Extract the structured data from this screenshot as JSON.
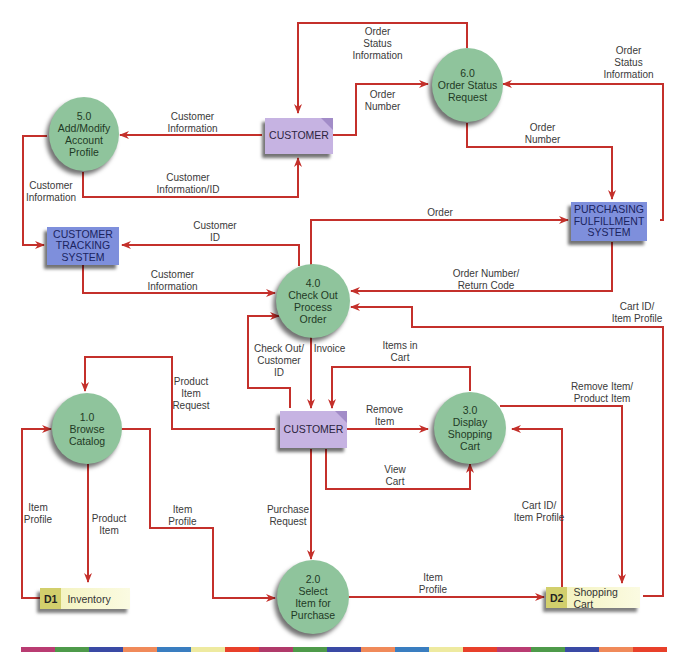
{
  "diagram": {
    "type": "data-flow-diagram",
    "arrow_color": "#c4302b",
    "processes": [
      {
        "id": "1.0",
        "number": "1.0",
        "name": "Browse\nCatalog",
        "lines": [
          "Browse",
          "Catalog"
        ]
      },
      {
        "id": "2.0",
        "number": "2.0",
        "name": "Select Item for Purchase",
        "lines": [
          "Select",
          "Item for",
          "Purchase"
        ]
      },
      {
        "id": "3.0",
        "number": "3.0",
        "name": "Display Shopping Cart",
        "lines": [
          "Display",
          "Shopping",
          "Cart"
        ]
      },
      {
        "id": "4.0",
        "number": "4.0",
        "name": "Check Out Process Order",
        "lines": [
          "Check Out",
          "Process",
          "Order"
        ]
      },
      {
        "id": "5.0",
        "number": "5.0",
        "name": "Add/Modify Account Profile",
        "lines": [
          "Add/Modify",
          "Account",
          "Profile"
        ]
      },
      {
        "id": "6.0",
        "number": "6.0",
        "name": "Order Status Request",
        "lines": [
          "Order Status",
          "Request"
        ]
      }
    ],
    "entities": {
      "customer_top": {
        "label": "CUSTOMER"
      },
      "customer_mid": {
        "label": "CUSTOMER"
      },
      "customer_tracking": {
        "lines": [
          "CUSTOMER",
          "TRACKING",
          "SYSTEM"
        ]
      },
      "purchasing": {
        "lines": [
          "PURCHASING",
          "FULFILLMENT",
          "SYSTEM"
        ]
      }
    },
    "data_stores": [
      {
        "id": "D1",
        "name": "Inventory"
      },
      {
        "id": "D2",
        "name": "Shopping Cart"
      }
    ],
    "flows": [
      {
        "label": "Order\nStatus\nInformation",
        "from": "6.0",
        "to": "CUSTOMER"
      },
      {
        "label": "Order\nNumber",
        "from": "CUSTOMER",
        "to": "6.0"
      },
      {
        "label": "Order\nStatus\nInformation",
        "from": "PURCHASING FULFILLMENT SYSTEM",
        "to": "6.0"
      },
      {
        "label": "Order\nNumber",
        "from": "6.0",
        "to": "PURCHASING FULFILLMENT SYSTEM"
      },
      {
        "label": "Customer\nInformation",
        "from": "CUSTOMER",
        "to": "5.0"
      },
      {
        "label": "Customer\nInformation/ID",
        "from": "5.0",
        "to": "CUSTOMER"
      },
      {
        "label": "Customer\nInformation",
        "from": "5.0",
        "to": "CUSTOMER TRACKING SYSTEM"
      },
      {
        "label": "Customer\nID",
        "from": "4.0",
        "to": "CUSTOMER TRACKING SYSTEM"
      },
      {
        "label": "Customer\nInformation",
        "from": "CUSTOMER TRACKING SYSTEM",
        "to": "4.0"
      },
      {
        "label": "Order",
        "from": "4.0",
        "to": "PURCHASING FULFILLMENT SYSTEM"
      },
      {
        "label": "Order Number/\nReturn Code",
        "from": "PURCHASING FULFILLMENT SYSTEM",
        "to": "4.0"
      },
      {
        "label": "Cart ID/\nItem Profile",
        "from": "D2",
        "to": "4.0"
      },
      {
        "label": "Check Out/\nCustomer\nID",
        "from": "CUSTOMER",
        "to": "4.0"
      },
      {
        "label": "Invoice",
        "from": "4.0",
        "to": "CUSTOMER"
      },
      {
        "label": "Items in\nCart",
        "from": "3.0",
        "to": "CUSTOMER"
      },
      {
        "label": "Product\nItem\nRequest",
        "from": "CUSTOMER",
        "to": "1.0"
      },
      {
        "label": "Remove\nItem",
        "from": "CUSTOMER",
        "to": "3.0"
      },
      {
        "label": "View\nCart",
        "from": "CUSTOMER",
        "to": "3.0"
      },
      {
        "label": "Remove Item/\nProduct Item",
        "from": "3.0",
        "to": "D2"
      },
      {
        "label": "Cart ID/\nItem Profile",
        "from": "D2",
        "to": "3.0"
      },
      {
        "label": "Item\nProfile",
        "from": "D1",
        "to": "1.0"
      },
      {
        "label": "Product\nItem",
        "from": "1.0",
        "to": "D1"
      },
      {
        "label": "Item\nProfile",
        "from": "1.0",
        "to": "2.0"
      },
      {
        "label": "Purchase\nRequest",
        "from": "CUSTOMER",
        "to": "2.0"
      },
      {
        "label": "Item\nProfile",
        "from": "2.0",
        "to": "D2"
      }
    ]
  },
  "labels": {
    "l_ostat_top": "Order\nStatus\nInformation",
    "l_onum_left": "Order\nNumber",
    "l_ostat_right": "Order\nStatus\nInformation",
    "l_onum_right": "Order\nNumber",
    "l_custinfo_top": "Customer\nInformation",
    "l_custinfo_id": "Customer\nInformation/ID",
    "l_custinfo_left": "Customer\nInformation",
    "l_custid": "Customer\nID",
    "l_custinfo_mid": "Customer\nInformation",
    "l_order": "Order",
    "l_onum_return": "Order Number/\nReturn Code",
    "l_cartid_top": "Cart ID/\nItem Profile",
    "l_checkout": "Check Out/\nCustomer\nID",
    "l_invoice": "Invoice",
    "l_items_in_cart": "Items in\nCart",
    "l_prod_req": "Product\nItem\nRequest",
    "l_remove_item": "Remove\nItem",
    "l_view_cart": "View\nCart",
    "l_remove_prod": "Remove Item/\nProduct Item",
    "l_cartid_bottom": "Cart ID/\nItem Profile",
    "l_item_profile_left": "Item\nProfile",
    "l_product_item": "Product\nItem",
    "l_item_profile_mid": "Item\nProfile",
    "l_purchase_req": "Purchase\nRequest",
    "l_item_profile_bottom": "Item\nProfile"
  },
  "colorbar": [
    "#b93c72",
    "#4e9a4a",
    "#3a4aa4",
    "#f08a5a",
    "#3a7ec0",
    "#eeeaa0",
    "#e8402a",
    "#b03a6a",
    "#4e9a4a",
    "#3a4aa4",
    "#f08a5a",
    "#3a7ec0",
    "#eeeaa0",
    "#e8402a",
    "#b93c72",
    "#4e9a4a",
    "#3a4aa4",
    "#f08a5a",
    "#e8402a"
  ]
}
